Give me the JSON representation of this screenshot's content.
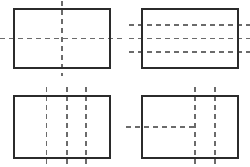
{
  "figure": {
    "type": "technical-drawing",
    "canvas": {
      "width": 250,
      "height": 167
    },
    "colors": {
      "background": "#ffffff",
      "outline": "#2b2b2b",
      "dash": "#6b6b6b"
    },
    "stroke": {
      "outline_width": 1.6,
      "dash_width": 1.5,
      "dash_pattern": "5 4"
    },
    "panels": [
      {
        "id": "panel-top-left",
        "label": "Rectangle with crossed centerlines",
        "rect": {
          "x": 14,
          "y": 9,
          "width": 96,
          "height": 59
        },
        "dashed_lines": [
          {
            "orientation": "horizontal",
            "position": 0.5,
            "overhang_start": 14,
            "overhang_end": 16
          },
          {
            "orientation": "vertical",
            "position": 0.5,
            "overhang_start": 8,
            "overhang_end": 8
          }
        ]
      },
      {
        "id": "panel-top-right",
        "label": "Rectangle with three horizontal hidden lines",
        "rect": {
          "x": 142,
          "y": 9,
          "width": 96,
          "height": 59
        },
        "dashed_lines": [
          {
            "orientation": "horizontal",
            "position": 0.27,
            "overhang_start": 13,
            "overhang_end": 12
          },
          {
            "orientation": "horizontal",
            "position": 0.5,
            "overhang_start": 13,
            "overhang_end": 12
          },
          {
            "orientation": "horizontal",
            "position": 0.73,
            "overhang_start": 13,
            "overhang_end": 12
          }
        ]
      },
      {
        "id": "panel-bottom-left",
        "label": "Rectangle with three vertical hidden lines",
        "rect": {
          "x": 14,
          "y": 96,
          "width": 96,
          "height": 62
        },
        "dashed_lines": [
          {
            "orientation": "vertical",
            "position": 0.34,
            "overhang_start": 9,
            "overhang_end": 9
          },
          {
            "orientation": "vertical",
            "position": 0.55,
            "overhang_start": 9,
            "overhang_end": 9
          },
          {
            "orientation": "vertical",
            "position": 0.75,
            "overhang_start": 9,
            "overhang_end": 9
          }
        ]
      },
      {
        "id": "panel-bottom-right",
        "label": "Rectangle with two vertical hidden lines and a truncated horizontal line",
        "rect": {
          "x": 142,
          "y": 96,
          "width": 96,
          "height": 62
        },
        "dashed_lines": [
          {
            "orientation": "vertical",
            "position": 0.55,
            "overhang_start": 9,
            "overhang_end": 9
          },
          {
            "orientation": "vertical",
            "position": 0.76,
            "overhang_start": 9,
            "overhang_end": 9
          }
        ],
        "partial_lines": [
          {
            "orientation": "horizontal",
            "position": 0.5,
            "overhang_start": 16,
            "stop_at_vertical": 0.55
          }
        ]
      }
    ]
  }
}
